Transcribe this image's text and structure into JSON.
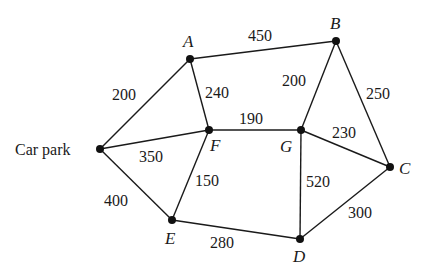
{
  "diagram": {
    "type": "weighted-undirected-graph",
    "nodes": [
      {
        "id": "CP",
        "label": "Car park",
        "x": 100,
        "y": 149
      },
      {
        "id": "A",
        "label": "A",
        "x": 190,
        "y": 59
      },
      {
        "id": "B",
        "label": "B",
        "x": 336,
        "y": 41
      },
      {
        "id": "C",
        "label": "C",
        "x": 390,
        "y": 167
      },
      {
        "id": "D",
        "label": "D",
        "x": 300,
        "y": 239
      },
      {
        "id": "E",
        "label": "E",
        "x": 172,
        "y": 220
      },
      {
        "id": "F",
        "label": "F",
        "x": 209,
        "y": 130
      },
      {
        "id": "G",
        "label": "G",
        "x": 301,
        "y": 130
      }
    ],
    "edges": [
      {
        "from": "CP",
        "to": "A",
        "weight": "200"
      },
      {
        "from": "CP",
        "to": "F",
        "weight": "350"
      },
      {
        "from": "CP",
        "to": "E",
        "weight": "400"
      },
      {
        "from": "A",
        "to": "B",
        "weight": "450"
      },
      {
        "from": "A",
        "to": "F",
        "weight": "240"
      },
      {
        "from": "F",
        "to": "G",
        "weight": "190"
      },
      {
        "from": "F",
        "to": "E",
        "weight": "150"
      },
      {
        "from": "B",
        "to": "G",
        "weight": "200"
      },
      {
        "from": "B",
        "to": "C",
        "weight": "250"
      },
      {
        "from": "G",
        "to": "C",
        "weight": "230"
      },
      {
        "from": "G",
        "to": "D",
        "weight": "520"
      },
      {
        "from": "E",
        "to": "D",
        "weight": "280"
      },
      {
        "from": "C",
        "to": "D",
        "weight": "300"
      }
    ]
  }
}
